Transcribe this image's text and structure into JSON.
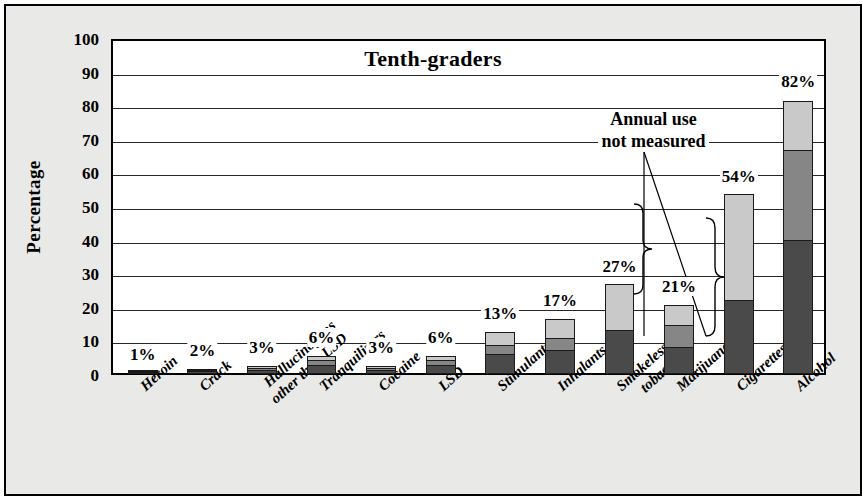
{
  "chart_data": {
    "type": "bar",
    "title": "Tenth-graders",
    "xlabel": "",
    "ylabel": "Percentage",
    "ylim": [
      0,
      100
    ],
    "ytick_step": 10,
    "yticks": [
      "0",
      "10",
      "20",
      "30",
      "40",
      "50",
      "60",
      "70",
      "80",
      "90",
      "100"
    ],
    "grid": true,
    "legend": null,
    "stacked": true,
    "series": [
      {
        "name": "lifetime-lower-segment",
        "color": "#4a4a4a"
      },
      {
        "name": "annual-middle-segment",
        "color": "#868686"
      },
      {
        "name": "upper-segment",
        "color": "#c9c9c9"
      }
    ],
    "categories": [
      "Heroin",
      "Hallucinogens other than LSD",
      "Crack",
      "Tranquilizers",
      "Cocaine",
      "LSD",
      "Stimulants",
      "Inhalants",
      "Smokeless tobacco",
      "Marijuana",
      "Cigarettes",
      "Alcohol"
    ],
    "bars": [
      {
        "label": "Heroin",
        "label_line1": "Heroin",
        "label_line2": "",
        "total": 1,
        "total_label": "1%",
        "segments": [
          0.5,
          0.3,
          0.2
        ]
      },
      {
        "label": "Crack",
        "label_line1": "Crack",
        "label_line2": "",
        "total": 2,
        "total_label": "2%",
        "segments": [
          0.9,
          0.6,
          0.5
        ]
      },
      {
        "label": "Hallucinogens other than LSD",
        "label_line1": "Hallucinogens",
        "label_line2": "other than LSD",
        "total": 3,
        "total_label": "3%",
        "segments": [
          1.3,
          0.9,
          0.8
        ]
      },
      {
        "label": "Tranquilizers",
        "label_line1": "Tranquilizers",
        "label_line2": "",
        "total": 6,
        "total_label": "6%",
        "segments": [
          2.7,
          1.7,
          1.6
        ]
      },
      {
        "label": "Cocaine",
        "label_line1": "Cocaine",
        "label_line2": "",
        "total": 3,
        "total_label": "3%",
        "segments": [
          1.3,
          0.9,
          0.8
        ]
      },
      {
        "label": "LSD",
        "label_line1": "LSD",
        "label_line2": "",
        "total": 6,
        "total_label": "6%",
        "segments": [
          2.7,
          1.7,
          1.6
        ]
      },
      {
        "label": "Stimulants",
        "label_line1": "Stimulants",
        "label_line2": "",
        "total": 13,
        "total_label": "13%",
        "segments": [
          6,
          3,
          4
        ]
      },
      {
        "label": "Inhalants",
        "label_line1": "Inhalants",
        "label_line2": "",
        "total": 17,
        "total_label": "17%",
        "segments": [
          7,
          4,
          6
        ]
      },
      {
        "label": "Smokeless tobacco",
        "label_line1": "Smokeless",
        "label_line2": "tobacco",
        "total": 27,
        "total_label": "27%",
        "segments": [
          13,
          0,
          14
        ]
      },
      {
        "label": "Marijuana",
        "label_line1": "Marijuana",
        "label_line2": "",
        "total": 21,
        "total_label": "21%",
        "segments": [
          8,
          7,
          6
        ]
      },
      {
        "label": "Cigarettes",
        "label_line1": "Cigarettes",
        "label_line2": "",
        "total": 54,
        "total_label": "54%",
        "segments": [
          22,
          0,
          32
        ]
      },
      {
        "label": "Alcohol",
        "label_line1": "Alcohol",
        "label_line2": "",
        "total": 82,
        "total_label": "82%",
        "segments": [
          40,
          27,
          15
        ]
      }
    ],
    "annotations": [
      {
        "name": "annual-use-not-measured",
        "line1": "Annual use",
        "line2": "not measured",
        "applies_to": [
          "Smokeless tobacco",
          "Cigarettes"
        ]
      }
    ]
  },
  "colors": {
    "segment_dark": "#4a4a4a",
    "segment_medium": "#868686",
    "segment_light": "#c9c9c9",
    "page_background": "#e9e9e7",
    "plot_background": "#ffffff",
    "axis": "#000000"
  }
}
